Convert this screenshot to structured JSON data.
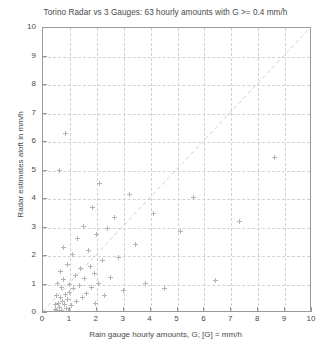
{
  "chart_data": {
    "type": "scatter",
    "title": "Torino Radar vs 3 Gauges: 63 hourly amounts with G >= 0.4 mm/h",
    "xlabel": "Rain gauge hourly amounts, G; [G] = mm/h",
    "ylabel": "Radar estimates aloft in mm/h",
    "xlim": [
      0,
      10
    ],
    "ylim": [
      0,
      10
    ],
    "xticks": [
      "0",
      "1",
      "2",
      "3",
      "4",
      "5",
      "6",
      "7",
      "8",
      "9",
      "10"
    ],
    "yticks": [
      "0",
      "1",
      "2",
      "3",
      "4",
      "5",
      "6",
      "7",
      "8",
      "9",
      "10"
    ],
    "xtick_values": [
      0,
      1,
      2,
      3,
      4,
      5,
      6,
      7,
      8,
      9,
      10
    ],
    "ytick_values": [
      0,
      1,
      2,
      3,
      4,
      5,
      6,
      7,
      8,
      9,
      10
    ],
    "grid": true,
    "grid_style": "dashed",
    "grid_color": "#d2d2d2",
    "marker": "plus-marker",
    "marker_color": "#b4b4b4",
    "n_points": 63,
    "reference_line": {
      "name": "one-to-one-line",
      "type": "diagonal",
      "from": [
        0,
        0
      ],
      "to": [
        10,
        10
      ],
      "style": "dashed",
      "color": "#eec4c4"
    },
    "legend": null,
    "points": [
      [
        0.42,
        0.05
      ],
      [
        0.45,
        0.3
      ],
      [
        0.48,
        0.12
      ],
      [
        0.5,
        0.62
      ],
      [
        0.52,
        0.08
      ],
      [
        0.55,
        1.05
      ],
      [
        0.58,
        0.35
      ],
      [
        0.6,
        0.2
      ],
      [
        0.62,
        5.0
      ],
      [
        0.64,
        0.55
      ],
      [
        0.66,
        1.45
      ],
      [
        0.68,
        0.9
      ],
      [
        0.7,
        0.1
      ],
      [
        0.72,
        0.42
      ],
      [
        0.75,
        2.3
      ],
      [
        0.78,
        1.18
      ],
      [
        0.8,
        0.3
      ],
      [
        0.82,
        6.3
      ],
      [
        0.85,
        0.65
      ],
      [
        0.88,
        0.15
      ],
      [
        0.9,
        1.7
      ],
      [
        0.92,
        0.48
      ],
      [
        0.95,
        0.05
      ],
      [
        0.98,
        1.0
      ],
      [
        1.0,
        0.72
      ],
      [
        1.05,
        0.25
      ],
      [
        1.1,
        2.05
      ],
      [
        1.15,
        0.85
      ],
      [
        1.2,
        1.3
      ],
      [
        1.25,
        0.4
      ],
      [
        1.3,
        2.6
      ],
      [
        1.35,
        0.95
      ],
      [
        1.4,
        1.55
      ],
      [
        1.45,
        0.55
      ],
      [
        1.5,
        3.05
      ],
      [
        1.55,
        1.2
      ],
      [
        1.6,
        0.7
      ],
      [
        1.7,
        2.2
      ],
      [
        1.75,
        1.62
      ],
      [
        1.8,
        0.9
      ],
      [
        1.85,
        3.7
      ],
      [
        1.9,
        1.4
      ],
      [
        1.95,
        0.35
      ],
      [
        2.0,
        2.75
      ],
      [
        2.05,
        1.05
      ],
      [
        2.1,
        4.55
      ],
      [
        2.2,
        1.85
      ],
      [
        2.3,
        0.62
      ],
      [
        2.4,
        2.95
      ],
      [
        2.5,
        1.25
      ],
      [
        2.65,
        3.35
      ],
      [
        2.8,
        1.95
      ],
      [
        3.0,
        0.78
      ],
      [
        3.2,
        4.15
      ],
      [
        3.45,
        2.4
      ],
      [
        3.8,
        1.05
      ],
      [
        4.1,
        3.5
      ],
      [
        4.5,
        0.85
      ],
      [
        5.1,
        2.85
      ],
      [
        5.6,
        4.05
      ],
      [
        6.4,
        1.15
      ],
      [
        7.3,
        3.2
      ],
      [
        8.6,
        5.45
      ]
    ]
  }
}
